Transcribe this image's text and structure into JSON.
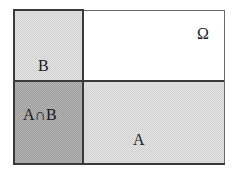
{
  "diagram": {
    "type": "set-partition-rectangle",
    "universe": {
      "label": "Ω",
      "fill": "#ffffff"
    },
    "regions": [
      {
        "id": "B",
        "label": "B",
        "position": "top-left",
        "fill": "#d2d2d2"
      },
      {
        "id": "universe",
        "label": "Ω",
        "position": "top-right",
        "fill": "#ffffff"
      },
      {
        "id": "A_and_B",
        "label": "A∩B",
        "position": "bottom-left",
        "fill": "#9c9c9c"
      },
      {
        "id": "A",
        "label": "A",
        "position": "bottom-right",
        "fill": "#d2d2d2"
      }
    ],
    "border_color": "#3a3a3a"
  }
}
